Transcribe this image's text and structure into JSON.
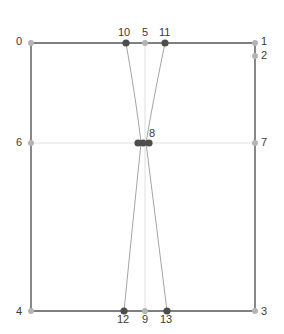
{
  "figure": {
    "type": "diagram",
    "background_color": "#ffffff",
    "width": 284,
    "height": 334
  },
  "style": {
    "frame_color": "#555555",
    "frame_width": 1.4,
    "guide_color": "#e2e2e2",
    "guide_width": 1.1,
    "curve_color": "#9a9a9a",
    "curve_width": 0.9,
    "dark_node_color": "#4d4d4d",
    "light_node_color": "#b4b4b4",
    "label_color": "#3a3a3a",
    "label_font_size": 11,
    "node_radius_dark": 3.6,
    "node_radius_light": 3.0
  },
  "frame": {
    "left": 31,
    "top": 43,
    "right": 255,
    "bottom": 311
  },
  "guides": [
    {
      "name": "horizontal-midline",
      "x1": 31,
      "y1": 143,
      "x2": 255,
      "y2": 143
    },
    {
      "name": "vertical-midline",
      "x1": 145,
      "y1": 43,
      "x2": 145,
      "y2": 311
    }
  ],
  "edges": [
    {
      "name": "edge-frame-top",
      "x1": 31,
      "y1": 43,
      "x2": 255,
      "y2": 43,
      "kind": "frame"
    },
    {
      "name": "edge-frame-right",
      "x1": 255,
      "y1": 43,
      "x2": 255,
      "y2": 311,
      "kind": "frame"
    },
    {
      "name": "edge-frame-bottom",
      "x1": 31,
      "y1": 311,
      "x2": 255,
      "y2": 311,
      "kind": "frame"
    },
    {
      "name": "edge-frame-left",
      "x1": 31,
      "y1": 43,
      "x2": 31,
      "y2": 311,
      "kind": "frame"
    }
  ],
  "curves": [
    {
      "name": "curve-10-to-8",
      "from": "10",
      "to": "8",
      "x1": 126,
      "y1": 43,
      "cx": 137,
      "cy": 106,
      "x2": 141,
      "y2": 143
    },
    {
      "name": "curve-11-to-8",
      "from": "11",
      "to": "8",
      "x1": 165,
      "y1": 43,
      "cx": 152,
      "cy": 106,
      "x2": 146,
      "y2": 143
    },
    {
      "name": "curve-8-to-12",
      "from": "8",
      "to": "12",
      "x1": 141,
      "y1": 143,
      "cx": 132,
      "cy": 230,
      "x2": 124,
      "y2": 311
    },
    {
      "name": "curve-8-to-13",
      "from": "8",
      "to": "13",
      "x1": 146,
      "y1": 143,
      "cx": 157,
      "cy": 230,
      "x2": 167,
      "y2": 311
    }
  ],
  "nodes": [
    {
      "id": "0",
      "name": "node-0",
      "x": 31,
      "y": 43,
      "tone": "light",
      "label": "0",
      "label_x": 16,
      "label_y": 36
    },
    {
      "id": "1",
      "name": "node-1",
      "x": 255,
      "y": 43,
      "tone": "light",
      "label": "1",
      "label_x": 261,
      "label_y": 36
    },
    {
      "id": "2",
      "name": "node-2",
      "x": 255,
      "y": 56,
      "tone": "light",
      "label": "2",
      "label_x": 261,
      "label_y": 50
    },
    {
      "id": "3",
      "name": "node-3",
      "x": 255,
      "y": 311,
      "tone": "light",
      "label": "3",
      "label_x": 261,
      "label_y": 306
    },
    {
      "id": "4",
      "name": "node-4",
      "x": 31,
      "y": 311,
      "tone": "light",
      "label": "4",
      "label_x": 16,
      "label_y": 306
    },
    {
      "id": "5",
      "name": "node-5",
      "x": 145,
      "y": 43,
      "tone": "light",
      "label": "5",
      "label_x": 142,
      "label_y": 27
    },
    {
      "id": "6",
      "name": "node-6",
      "x": 31,
      "y": 143,
      "tone": "light",
      "label": "6",
      "label_x": 16,
      "label_y": 137
    },
    {
      "id": "7",
      "name": "node-7",
      "x": 255,
      "y": 143,
      "tone": "light",
      "label": "7",
      "label_x": 261,
      "label_y": 137
    },
    {
      "id": "8",
      "name": "node-8",
      "x": 143,
      "y": 143,
      "tone": "dark",
      "label": "8",
      "label_x": 149,
      "label_y": 128
    },
    {
      "id": "8b",
      "name": "node-8-overlap-left",
      "x": 138,
      "y": 143,
      "tone": "dark",
      "label": "",
      "label_x": 0,
      "label_y": 0
    },
    {
      "id": "8c",
      "name": "node-8-overlap-right",
      "x": 149,
      "y": 143,
      "tone": "dark",
      "label": "",
      "label_x": 0,
      "label_y": 0
    },
    {
      "id": "9",
      "name": "node-9",
      "x": 145,
      "y": 311,
      "tone": "light",
      "label": "9",
      "label_x": 142,
      "label_y": 314
    },
    {
      "id": "10",
      "name": "node-10",
      "x": 126,
      "y": 43,
      "tone": "dark",
      "label": "10",
      "label_x": 118,
      "label_y": 27
    },
    {
      "id": "11",
      "name": "node-11",
      "x": 165,
      "y": 43,
      "tone": "dark",
      "label": "11",
      "label_x": 159,
      "label_y": 27
    },
    {
      "id": "12",
      "name": "node-12",
      "x": 124,
      "y": 311,
      "tone": "dark",
      "label": "12",
      "label_x": 117,
      "label_y": 314
    },
    {
      "id": "13",
      "name": "node-13",
      "x": 167,
      "y": 311,
      "tone": "dark",
      "label": "13",
      "label_x": 160,
      "label_y": 314
    }
  ]
}
